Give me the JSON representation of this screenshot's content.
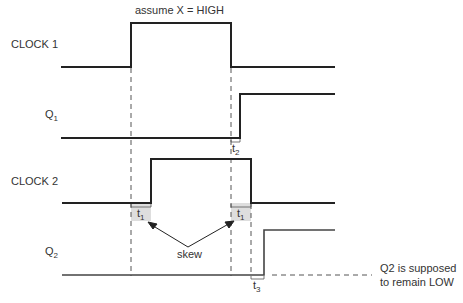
{
  "title": "assume X = HIGH",
  "signals": [
    {
      "name": "CLOCK 1",
      "label": "CLOCK 1"
    },
    {
      "name": "Q1",
      "label_main": "Q",
      "label_sub": "1"
    },
    {
      "name": "CLOCK 2",
      "label": "CLOCK 2"
    },
    {
      "name": "Q2",
      "label_main": "Q",
      "label_sub": "2"
    }
  ],
  "timing_labels": {
    "t1_left": {
      "main": "t",
      "sub": "1"
    },
    "t1_right": {
      "main": "t",
      "sub": "1"
    },
    "t2": {
      "main": "t",
      "sub": "2"
    },
    "t3": {
      "main": "t",
      "sub": "3"
    }
  },
  "skew_label": "skew",
  "note_line1": "Q2 is supposed",
  "note_line2": "to remain LOW",
  "colors": {
    "line": "#222222",
    "dash": "#555555",
    "shade": "#d8d8d8",
    "text": "#333333"
  }
}
